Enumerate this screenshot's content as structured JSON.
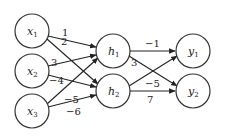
{
  "diagram": {
    "type": "neural-network",
    "nodes": {
      "inputs": [
        {
          "id": "x1",
          "base": "x",
          "sub": "1",
          "cx": 32,
          "cy": 31
        },
        {
          "id": "x2",
          "base": "x",
          "sub": "2",
          "cx": 32,
          "cy": 71
        },
        {
          "id": "x3",
          "base": "x",
          "sub": "3",
          "cx": 32,
          "cy": 111
        }
      ],
      "hidden": [
        {
          "id": "h1",
          "base": "h",
          "sub": "1",
          "cx": 113,
          "cy": 51
        },
        {
          "id": "h2",
          "base": "h",
          "sub": "2",
          "cx": 113,
          "cy": 91
        }
      ],
      "outputs": [
        {
          "id": "y1",
          "base": "y",
          "sub": "1",
          "cx": 193,
          "cy": 51
        },
        {
          "id": "y2",
          "base": "y",
          "sub": "2",
          "cx": 193,
          "cy": 91
        }
      ]
    },
    "edges": [
      {
        "from": "x1",
        "to": "h1",
        "weight": "1"
      },
      {
        "from": "x1",
        "to": "h2",
        "weight": "2"
      },
      {
        "from": "x2",
        "to": "h1",
        "weight": "3"
      },
      {
        "from": "x2",
        "to": "h2",
        "weight": "−4"
      },
      {
        "from": "x3",
        "to": "h1",
        "weight": "−5"
      },
      {
        "from": "x3",
        "to": "h2",
        "weight": "−6"
      },
      {
        "from": "h1",
        "to": "y1",
        "weight": "−1"
      },
      {
        "from": "h1",
        "to": "y2",
        "weight": "3"
      },
      {
        "from": "h2",
        "to": "y1",
        "weight": "−5"
      },
      {
        "from": "h2",
        "to": "y2",
        "weight": "7"
      }
    ],
    "node_radius": 17
  },
  "labels": {
    "x1": "x",
    "x1_sub": "1",
    "x2": "x",
    "x2_sub": "2",
    "x3": "x",
    "x3_sub": "3",
    "h1": "h",
    "h1_sub": "1",
    "h2": "h",
    "h2_sub": "2",
    "y1": "y",
    "y1_sub": "1",
    "y2": "y",
    "y2_sub": "2",
    "w_x1_h1": "1",
    "w_x1_h2": "2",
    "w_x2_h1": "3",
    "w_x2_h2": "−4",
    "w_x3_h1": "−5",
    "w_x3_h2": "−6",
    "w_h1_y1": "−1",
    "w_h1_y2": "3",
    "w_h2_y1": "−5",
    "w_h2_y2": "7"
  }
}
